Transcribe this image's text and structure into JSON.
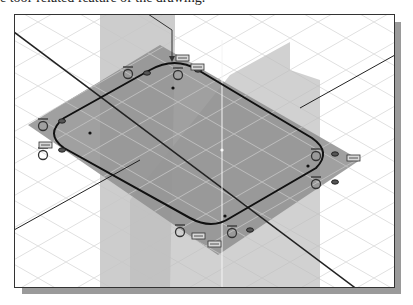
{
  "caption": {
    "text": "e tool-related feature of the drawing."
  },
  "viewport": {
    "view": "isometric",
    "background": "#ffffff",
    "grid_color": "#e2e2e2",
    "plane_color": "#9a9a9a",
    "sketch_line_color": "#111111",
    "frame_color": "#333333",
    "shadow_color": "#9a9a9a"
  },
  "sketch": {
    "shape": "rounded-slot",
    "constraints": [
      {
        "type": "tangent",
        "label": "tangent-icon-top-left"
      },
      {
        "type": "tangent",
        "label": "tangent-icon-top"
      },
      {
        "type": "equal",
        "label": "equal-icon-top-1"
      },
      {
        "type": "equal",
        "label": "equal-icon-top-2"
      },
      {
        "type": "tangent",
        "label": "tangent-icon-left-top"
      },
      {
        "type": "tangent",
        "label": "tangent-icon-left-bottom"
      },
      {
        "type": "tangent",
        "label": "tangent-icon-right-top"
      },
      {
        "type": "equal",
        "label": "equal-icon-right"
      },
      {
        "type": "tangent",
        "label": "tangent-icon-right-bottom"
      },
      {
        "type": "tangent",
        "label": "tangent-icon-bottom-left"
      },
      {
        "type": "equal",
        "label": "equal-icon-bottom-1"
      },
      {
        "type": "equal",
        "label": "equal-icon-bottom-2"
      },
      {
        "type": "tangent",
        "label": "tangent-icon-bottom"
      }
    ]
  }
}
